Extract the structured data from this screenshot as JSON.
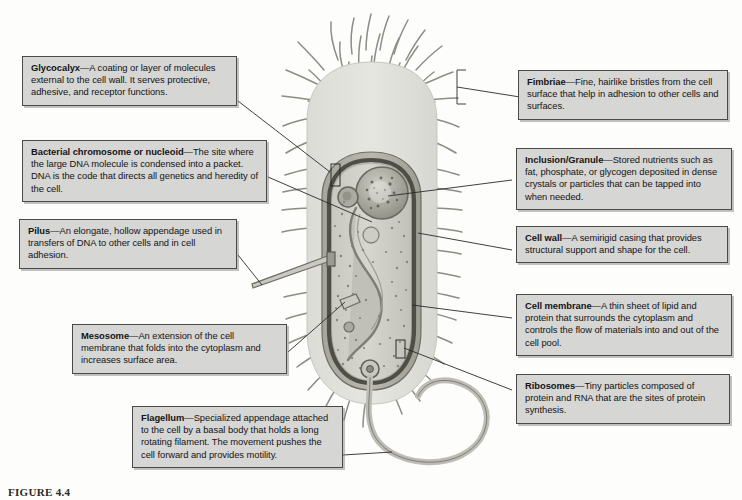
{
  "figure": {
    "caption": "FIGURE 4.4"
  },
  "callouts": [
    {
      "id": "glycocalyx",
      "term": "Glycocalyx",
      "text": "—A coating or layer of molecules external to the cell wall.  It serves protective, adhesive, and receptor functions."
    },
    {
      "id": "nucleoid",
      "term": "Bacterial chromosome or nucleoid",
      "text": "—The site where the large DNA molecule is condensed into a packet.  DNA is the code that directs all genetics and heredity of the cell."
    },
    {
      "id": "pilus",
      "term": "Pilus",
      "text": "—An elongate, hollow appendage used in transfers of DNA to other cells and in cell adhesion."
    },
    {
      "id": "mesosome",
      "term": "Mesosome",
      "text": "—An extension of the cell membrane that folds into the cytoplasm and increases surface area."
    },
    {
      "id": "flagellum",
      "term": "Flagellum",
      "text": "—Specialized appendage attached to the cell by a basal body that holds a long rotating filament. The movement pushes the cell forward and provides motility."
    },
    {
      "id": "fimbriae",
      "term": "Fimbriae",
      "text": "—Fine, hairlike bristles from the cell surface that help in adhesion to other cells and surfaces."
    },
    {
      "id": "inclusion",
      "term": "Inclusion/Granule",
      "text": "—Stored nutrients such as fat, phosphate, or glycogen deposited in dense crystals or particles that can be tapped into when needed."
    },
    {
      "id": "cellwall",
      "term": "Cell wall",
      "text": "—A semirigid casing that provides structural support and shape for the cell."
    },
    {
      "id": "cellmembrane",
      "term": "Cell membrane",
      "text": "—A thin sheet of lipid and protein that surrounds the cytoplasm and controls the flow of materials into and out of the cell pool."
    },
    {
      "id": "ribosomes",
      "term": "Ribosomes",
      "text": "—Tiny particles composed of protein and RNA that are the sites of protein synthesis."
    }
  ],
  "colors": {
    "box_fill": "#d6d6d4",
    "box_border": "#4a4a4a",
    "page_bg": "#fdfdfc",
    "glycocalyx": "#e2e2de",
    "cell_wall": "#9a9a92",
    "cell_membrane": "#58584f",
    "cytoplasm": "#d2d2cb",
    "nucleoid": "#a8a89f",
    "inclusion": "#b5b5ac",
    "flagellum": "#c4c4bc",
    "leader_line": "#2a2a2a"
  }
}
